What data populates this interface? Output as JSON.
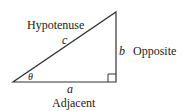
{
  "diagram": {
    "type": "right-triangle",
    "labels": {
      "hypotenuse": "Hypotenuse",
      "opposite": "Opposite",
      "adjacent": "Adjacent",
      "side_c": "c",
      "side_b": "b",
      "side_a": "a",
      "angle": "θ"
    },
    "colors": {
      "stroke": "#333333",
      "text": "#222222",
      "background": "#ffffff"
    }
  }
}
